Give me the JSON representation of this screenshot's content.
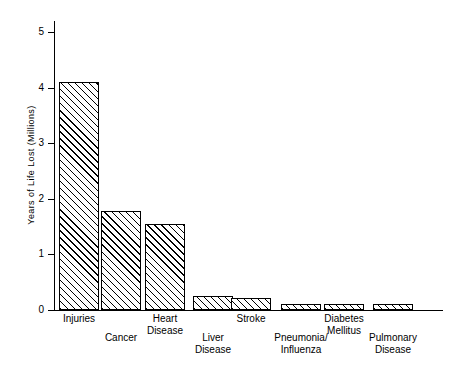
{
  "chart_data": {
    "type": "bar",
    "title": "",
    "subtitle": "",
    "xlabel": "",
    "ylabel": "Years of Life Lost (Millions)",
    "ylim": [
      0,
      5.2
    ],
    "yticks": [
      0,
      1,
      2,
      3,
      4,
      5
    ],
    "ytick_labels": [
      "0",
      "1",
      "2",
      "3",
      "4",
      "5"
    ],
    "grid": false,
    "legend": null,
    "categories": [
      "Injuries",
      "Cancer",
      "Heart\nDisease",
      "Liver\nDisease",
      "Stroke",
      "Pneumonia/\nInfluenza",
      "Diabetes\nMellitus",
      "Pulmonary\nDisease"
    ],
    "values": [
      4.1,
      1.78,
      1.55,
      0.25,
      0.22,
      0.1,
      0.1,
      0.1
    ],
    "bar_style": {
      "fill": "diagonal-hatch",
      "edge_color": "#000000",
      "face_color": "#ffffff"
    },
    "label_rows": [
      "top",
      "bottom",
      "top",
      "bottom",
      "top",
      "bottom",
      "top",
      "bottom"
    ]
  },
  "axis": {
    "y_title": "Years of Life Lost (Millions)"
  }
}
